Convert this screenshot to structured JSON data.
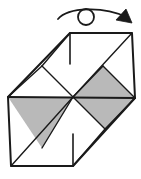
{
  "diagram": {
    "type": "paper-folding-diagram",
    "canvas": {
      "width": 141,
      "height": 179
    },
    "colors": {
      "background": "#ffffff",
      "stroke": "#1a1a1a",
      "shaded_fill": "#b9b9b9",
      "unshaded_fill": "#ffffff",
      "arrow_stroke": "#1a1a1a"
    },
    "stroke_widths": {
      "outline": 2.0,
      "interior": 1.4,
      "tick": 1.6,
      "arrow": 1.8
    },
    "rotation_symbol": {
      "name": "rotate-arrow",
      "description": "curved arrow passing over a small circle, indicating turn over / rotate",
      "circle": {
        "cx": 86,
        "cy": 17,
        "r": 8
      },
      "arc_path": "M 58,19 C 68,7 104,6 126,17",
      "arrowhead_points": "126,10 131,22 117,20"
    },
    "outline": {
      "name": "figure-outline",
      "points": "70,33 132,33 135,98 73,166 11,166 8,97"
    },
    "shaded_regions": [
      {
        "name": "left-shaded-triangle",
        "points": "8,97 73,97 42,148"
      },
      {
        "name": "right-shaded-diamond",
        "points": "73,97 103,66 135,98 105,129"
      }
    ],
    "interior_lines": [
      {
        "name": "center-horizontal-fold",
        "x1": 8,
        "y1": 97,
        "x2": 135,
        "y2": 98
      },
      {
        "name": "upper-left-valley-fold",
        "x1": 8,
        "y1": 97,
        "x2": 42,
        "y2": 66
      },
      {
        "name": "upper-left-to-center-fold",
        "x1": 42,
        "y1": 66,
        "x2": 73,
        "y2": 97
      },
      {
        "name": "upper-left-edge-fold",
        "x1": 42,
        "y1": 66,
        "x2": 70,
        "y2": 33
      },
      {
        "name": "center-to-upper-right-fold",
        "x1": 73,
        "y1": 97,
        "x2": 132,
        "y2": 33
      },
      {
        "name": "right-peak-fold",
        "x1": 103,
        "y1": 66,
        "x2": 135,
        "y2": 98
      },
      {
        "name": "right-lower-fold",
        "x1": 135,
        "y1": 98,
        "x2": 105,
        "y2": 129
      },
      {
        "name": "lower-right-to-bottom-fold",
        "x1": 105,
        "y1": 129,
        "x2": 73,
        "y2": 166
      },
      {
        "name": "center-to-lower-left-fold",
        "x1": 73,
        "y1": 97,
        "x2": 11,
        "y2": 166
      },
      {
        "name": "lower-left-valley-fold",
        "x1": 42,
        "y1": 148,
        "x2": 73,
        "y2": 97
      }
    ],
    "tick_marks": [
      {
        "name": "top-reference-tick",
        "x1": 70,
        "y1": 33,
        "x2": 70,
        "y2": 64
      },
      {
        "name": "bottom-reference-tick",
        "x1": 73,
        "y1": 166,
        "x2": 73,
        "y2": 134
      }
    ]
  }
}
